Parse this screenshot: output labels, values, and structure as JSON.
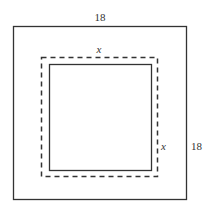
{
  "diagram": {
    "outer_square": {
      "top_label": "18",
      "right_label": "18"
    },
    "dashed_square": {
      "top_label": "x",
      "right_label": "x"
    },
    "colors": {
      "stroke": "#333333",
      "background": "#ffffff"
    }
  }
}
